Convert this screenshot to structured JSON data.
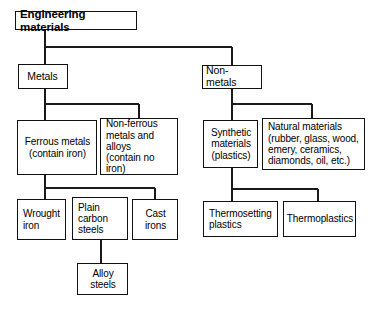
{
  "diagram": {
    "type": "tree-hierarchy",
    "line_color": "#111111",
    "box_border_color": "#111111",
    "background_color": "#ffffff",
    "nodes": {
      "root": "Engineering materials",
      "metals": "Metals",
      "non_metals": "Non-metals",
      "ferrous": "Ferrous metals\n(contain iron)",
      "non_ferrous": "Non-ferrous\nmetals and\nalloys\n(contain no iron)",
      "synthetic": "Synthetic\nmaterials\n(plastics)",
      "natural": "Natural materials\n(rubber, glass, wood,\nemery, ceramics,\ndiamonds, oil, etc.)",
      "wrought_iron": "Wrought\niron",
      "plain_carbon_steels": "Plain\ncarbon\nsteels",
      "cast_irons": "Cast\nirons",
      "alloy_steels": "Alloy\nsteels",
      "thermosetting": "Thermosetting\nplastics",
      "thermoplastics": "Thermoplastics"
    }
  }
}
